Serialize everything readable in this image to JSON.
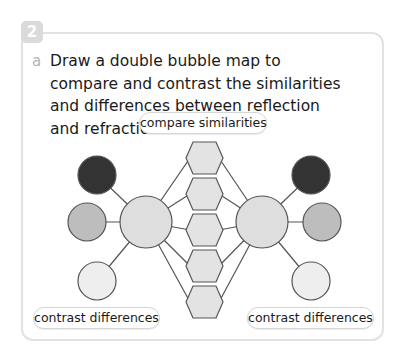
{
  "question": {
    "number": "2",
    "part": "a",
    "text": "Draw a double bubble map to compare and contrast the similarities and differences between reflection and refraction."
  },
  "diagram": {
    "type": "double-bubble-map",
    "labels": {
      "compare": "compare similarities",
      "contrast_left": "contrast differences",
      "contrast_right": "contrast differences"
    },
    "colors": {
      "dark": "#333333",
      "mid": "#bdbdbd",
      "light": "#eeeeee",
      "center": "#dedede",
      "hexagon": "#e3e3e3",
      "stroke": "#555555",
      "card_border": "#e2e2e2",
      "badge": "#dadada"
    },
    "center_bubbles": 2,
    "similarity_hexagons": 5,
    "difference_bubbles_per_side": 3
  }
}
